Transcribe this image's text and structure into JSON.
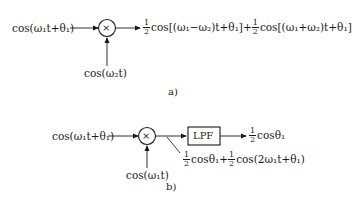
{
  "diagram_a": {
    "label": "a)",
    "input": "cos(ω₁t+θ₁)",
    "mixer_symbol": "×",
    "lo_input": "cos(ω₂t)",
    "output_term1_coef_num": "1",
    "output_term1_coef_den": "2",
    "output_term1": "cos[(ω₁−ω₂)t+θ₁]",
    "plus": "+",
    "output_term2_coef_num": "1",
    "output_term2_coef_den": "2",
    "output_term2": "cos[(ω₁+ω₂)t+θ₁]"
  },
  "diagram_b": {
    "label": "b)",
    "input": "cos(ω₁t+θ₁)",
    "mixer_symbol": "×",
    "lo_input": "cos(ω₁t)",
    "filter_label": "LPF",
    "output_coef_num": "1",
    "output_coef_den": "2",
    "output": "cosθ₁",
    "mixer_out_term1_coef_num": "1",
    "mixer_out_term1_coef_den": "2",
    "mixer_out_term1": "cosθ₁",
    "plus": "+",
    "mixer_out_term2_coef_num": "1",
    "mixer_out_term2_coef_den": "2",
    "mixer_out_term2": "cos(2ω₁t+θ₁)"
  }
}
